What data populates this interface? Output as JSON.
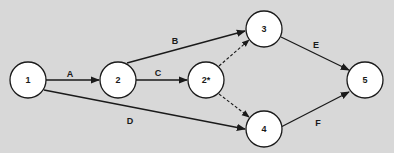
{
  "diagram": {
    "type": "activity-on-arrow network",
    "colors": {
      "background": "#d8d8d8",
      "node_fill": "#ffffff",
      "stroke": "#1a1a1a"
    },
    "nodes": [
      {
        "id": "n1",
        "label": "1",
        "x": 28,
        "y": 80
      },
      {
        "id": "n2",
        "label": "2",
        "x": 118,
        "y": 80
      },
      {
        "id": "n2s",
        "label": "2*",
        "x": 206,
        "y": 80
      },
      {
        "id": "n3",
        "label": "3",
        "x": 264,
        "y": 29
      },
      {
        "id": "n4",
        "label": "4",
        "x": 264,
        "y": 129
      },
      {
        "id": "n5",
        "label": "5",
        "x": 365,
        "y": 80
      }
    ],
    "edges": [
      {
        "from": "1",
        "to": "2",
        "label": "A",
        "style": "solid"
      },
      {
        "from": "2",
        "to": "3",
        "label": "B",
        "style": "solid"
      },
      {
        "from": "2",
        "to": "2*",
        "label": "C",
        "style": "solid"
      },
      {
        "from": "1",
        "to": "4",
        "label": "D",
        "style": "solid"
      },
      {
        "from": "3",
        "to": "5",
        "label": "E",
        "style": "solid"
      },
      {
        "from": "4",
        "to": "5",
        "label": "F",
        "style": "solid"
      },
      {
        "from": "2*",
        "to": "3",
        "label": "",
        "style": "dashed"
      },
      {
        "from": "2*",
        "to": "4",
        "label": "",
        "style": "dashed"
      }
    ],
    "edge_labels": {
      "A": "A",
      "B": "B",
      "C": "C",
      "D": "D",
      "E": "E",
      "F": "F"
    },
    "node_labels": {
      "n1": "1",
      "n2": "2",
      "n2s": "2*",
      "n3": "3",
      "n4": "4",
      "n5": "5"
    }
  }
}
